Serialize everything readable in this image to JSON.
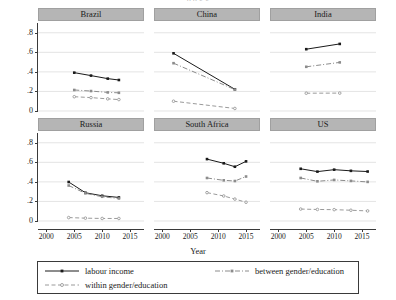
{
  "figure": {
    "cut_title": "p                    p                                      g                          g",
    "xlabel": "Year",
    "panel_header_color": "#b5b5b5",
    "ink_color": "#2b2b2b",
    "grid_color": "#d9d9d9",
    "labour_color": "#1a1a1a",
    "between_color": "#8c8c8c",
    "within_color": "#9a9a9a"
  },
  "legend": {
    "items": [
      {
        "key": "labour-income",
        "label": "labour income",
        "style": "solid"
      },
      {
        "key": "between-gender-education",
        "label": "between gender/education",
        "style": "dash-dot"
      },
      {
        "key": "within-gender-education",
        "label": "within gender/education",
        "style": "dashed"
      }
    ]
  },
  "axes": {
    "y_ticks": [
      "0",
      ".2",
      ".4",
      ".6",
      ".8"
    ],
    "y_values": [
      0,
      0.2,
      0.4,
      0.6,
      0.8
    ],
    "ylim": [
      0,
      0.9
    ],
    "x_ticks": [
      "2000",
      "2005",
      "2010",
      "2015"
    ],
    "x_values": [
      2000,
      2005,
      2010,
      2015
    ],
    "xlim": [
      1998.5,
      2017.5
    ]
  },
  "chart_data": {
    "type": "line",
    "title": "",
    "xlabel": "Year",
    "ylabel": "",
    "xlim": [
      1998.5,
      2017.5
    ],
    "ylim": [
      0,
      0.9
    ],
    "grid": true,
    "legend_position": "bottom",
    "panel_layout": [
      3,
      2
    ],
    "series_names": [
      "labour income",
      "between gender/education",
      "within gender/education"
    ],
    "panels": [
      {
        "name": "Brazil",
        "series": [
          {
            "name": "labour income",
            "style": "solid",
            "x": [
              2005,
              2008,
              2011,
              2013
            ],
            "y": [
              0.392,
              0.362,
              0.331,
              0.317
            ]
          },
          {
            "name": "between gender/education",
            "style": "dash-dot",
            "x": [
              2005,
              2008,
              2011,
              2013
            ],
            "y": [
              0.215,
              0.204,
              0.19,
              0.186
            ]
          },
          {
            "name": "within gender/education",
            "style": "dashed",
            "x": [
              2005,
              2008,
              2011,
              2013
            ],
            "y": [
              0.146,
              0.137,
              0.124,
              0.117
            ]
          }
        ]
      },
      {
        "name": "China",
        "series": [
          {
            "name": "labour income",
            "style": "solid",
            "x": [
              2002,
              2013
            ],
            "y": [
              0.59,
              0.222
            ]
          },
          {
            "name": "between gender/education",
            "style": "dash-dot",
            "x": [
              2002,
              2013
            ],
            "y": [
              0.489,
              0.219
            ]
          },
          {
            "name": "within gender/education",
            "style": "dashed",
            "x": [
              2002,
              2013
            ],
            "y": [
              0.1,
              0.026
            ]
          }
        ]
      },
      {
        "name": "India",
        "series": [
          {
            "name": "labour income",
            "style": "solid",
            "x": [
              2005,
              2011
            ],
            "y": [
              0.632,
              0.686
            ]
          },
          {
            "name": "between gender/education",
            "style": "dash-dot",
            "x": [
              2005,
              2011
            ],
            "y": [
              0.452,
              0.497
            ]
          },
          {
            "name": "within gender/education",
            "style": "dashed",
            "x": [
              2005,
              2011
            ],
            "y": [
              0.182,
              0.183
            ]
          }
        ]
      },
      {
        "name": "Russia",
        "series": [
          {
            "name": "labour income",
            "style": "solid",
            "x": [
              2004,
              2007,
              2010,
              2013
            ],
            "y": [
              0.399,
              0.289,
              0.258,
              0.241
            ]
          },
          {
            "name": "between gender/education",
            "style": "dash-dot",
            "x": [
              2004,
              2007,
              2010,
              2013
            ],
            "y": [
              0.363,
              0.283,
              0.248,
              0.23
            ]
          },
          {
            "name": "within gender/education",
            "style": "dashed",
            "x": [
              2004,
              2007,
              2010,
              2013
            ],
            "y": [
              0.035,
              0.029,
              0.026,
              0.026
            ]
          }
        ]
      },
      {
        "name": "South Africa",
        "series": [
          {
            "name": "labour income",
            "style": "solid",
            "x": [
              2008,
              2011,
              2013,
              2015
            ],
            "y": [
              0.633,
              0.59,
              0.555,
              0.61
            ]
          },
          {
            "name": "between gender/education",
            "style": "dash-dot",
            "x": [
              2008,
              2011,
              2013,
              2015
            ],
            "y": [
              0.44,
              0.416,
              0.409,
              0.455
            ]
          },
          {
            "name": "within gender/education",
            "style": "dashed",
            "x": [
              2008,
              2011,
              2013,
              2015
            ],
            "y": [
              0.29,
              0.256,
              0.224,
              0.192
            ]
          }
        ]
      },
      {
        "name": "US",
        "series": [
          {
            "name": "labour income",
            "style": "solid",
            "x": [
              2004,
              2007,
              2010,
              2013,
              2016
            ],
            "y": [
              0.534,
              0.505,
              0.525,
              0.513,
              0.506
            ]
          },
          {
            "name": "between gender/education",
            "style": "dash-dot",
            "x": [
              2004,
              2007,
              2010,
              2013,
              2016
            ],
            "y": [
              0.44,
              0.406,
              0.42,
              0.41,
              0.4
            ]
          },
          {
            "name": "within gender/education",
            "style": "dashed",
            "x": [
              2004,
              2007,
              2010,
              2013,
              2016
            ],
            "y": [
              0.122,
              0.118,
              0.116,
              0.11,
              0.103
            ]
          }
        ]
      }
    ]
  }
}
